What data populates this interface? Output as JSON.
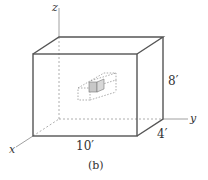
{
  "figure": {
    "caption": "(b)",
    "axes": {
      "x": "x",
      "y": "y",
      "z": "z"
    },
    "dimensions": {
      "length": "10′",
      "depth": "4′",
      "height": "8′"
    },
    "colors": {
      "line": "#555555",
      "dashed": "#888888",
      "shaded": "#c8c8c8"
    }
  }
}
